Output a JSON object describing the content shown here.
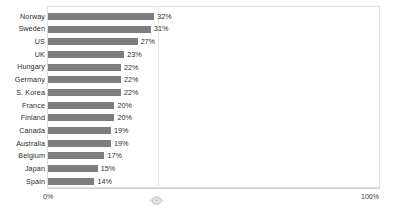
{
  "chart_data": {
    "type": "bar",
    "orientation": "horizontal",
    "title": "",
    "subtitle": "",
    "xlabel": "",
    "ylabel": "",
    "xlim": [
      0,
      100
    ],
    "grid": true,
    "legend": null,
    "value_suffix": "%",
    "categories": [
      "Norway",
      "Sweden",
      "US",
      "UK",
      "Hungary",
      "Germany",
      "S. Korea",
      "France",
      "Finland",
      "Canada",
      "Australia",
      "Belgium",
      "Japan",
      "Spain"
    ],
    "values": [
      32,
      31,
      27,
      23,
      22,
      22,
      22,
      20,
      20,
      19,
      19,
      17,
      15,
      14
    ],
    "value_labels": [
      "32%",
      "31%",
      "27%",
      "23%",
      "22%",
      "22%",
      "22%",
      "20%",
      "20%",
      "19%",
      "19%",
      "17%",
      "15%",
      "14%"
    ],
    "xticks": [
      0,
      100
    ],
    "xtick_labels": [
      "0%",
      "100%"
    ],
    "rows": [
      {
        "label": "Norway",
        "value": 32,
        "value_label": "32%"
      },
      {
        "label": "Sweden",
        "value": 31,
        "value_label": "31%"
      },
      {
        "label": "US",
        "value": 27,
        "value_label": "27%"
      },
      {
        "label": "UK",
        "value": 23,
        "value_label": "23%"
      },
      {
        "label": "Hungary",
        "value": 22,
        "value_label": "22%"
      },
      {
        "label": "Germany",
        "value": 22,
        "value_label": "22%"
      },
      {
        "label": "S. Korea",
        "value": 22,
        "value_label": "22%"
      },
      {
        "label": "France",
        "value": 20,
        "value_label": "20%"
      },
      {
        "label": "Finland",
        "value": 20,
        "value_label": "20%"
      },
      {
        "label": "Canada",
        "value": 19,
        "value_label": "19%"
      },
      {
        "label": "Australia",
        "value": 19,
        "value_label": "19%"
      },
      {
        "label": "Belgium",
        "value": 17,
        "value_label": "17%"
      },
      {
        "label": "Japan",
        "value": 15,
        "value_label": "15%"
      },
      {
        "label": "Spain",
        "value": 14,
        "value_label": "14%"
      }
    ],
    "colors": {
      "bar": "#7d7d7d",
      "background": "#ffffff",
      "frame": "#dcdcdc",
      "gridline": "#e6e6e6",
      "text": "#2b2b2b"
    }
  },
  "overlay": {
    "artifact_icon": "cursor-artifact-icon"
  }
}
